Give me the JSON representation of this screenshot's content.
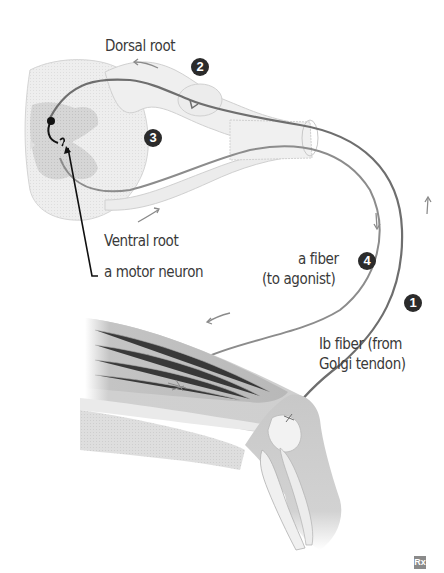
{
  "diagram": {
    "labels": {
      "dorsal_root": "Dorsal root",
      "ventral_root": "Ventral root",
      "motor_neuron": "a motor neuron",
      "a_fiber_line1": "a fiber",
      "a_fiber_line2": "(to agonist)",
      "ib_fiber_line1": "Ib fiber (from",
      "ib_fiber_line2": "Golgi tendon)"
    },
    "steps": [
      {
        "number": "1",
        "position": "on Ib fiber near knee"
      },
      {
        "number": "2",
        "position": "near dorsal root"
      },
      {
        "number": "3",
        "position": "between dorsal and ventral roots"
      },
      {
        "number": "4",
        "position": "on a fiber (to agonist)"
      }
    ],
    "watermark": "Rx",
    "colors": {
      "text": "#3a3a3a",
      "badge": "#2b2b2b",
      "ib_fiber": "#6e6e6e",
      "a_fiber": "#8c8c8c",
      "muscle": "#bdbdbd",
      "spinal_cord_gray_matter": "#c8c8c8",
      "background": "#ffffff"
    }
  }
}
